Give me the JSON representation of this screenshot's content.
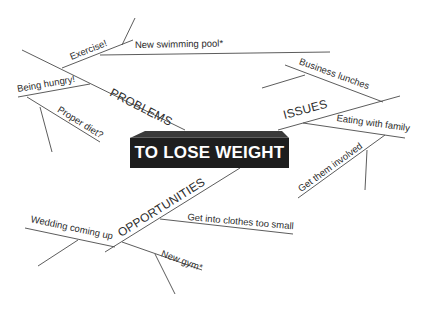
{
  "diagram": {
    "type": "mind-map",
    "center": {
      "label": "TO LOSE WEIGHT"
    },
    "branches": [
      {
        "label": "PROBLEMS",
        "children": [
          {
            "label": "Exercise!",
            "children": [
              {
                "label": "New swimming pool*"
              }
            ]
          },
          {
            "label": "Being hungry!",
            "children": [
              {
                "label": "Proper diet?"
              }
            ]
          }
        ]
      },
      {
        "label": "ISSUES",
        "children": [
          {
            "label": "Business lunches"
          },
          {
            "label": "Eating with family",
            "children": [
              {
                "label": "Get them involved"
              }
            ]
          }
        ]
      },
      {
        "label": "OPPORTUNITIES",
        "children": [
          {
            "label": "Get into clothes too small"
          },
          {
            "label": "Wedding coming up"
          },
          {
            "label": "New gym*"
          }
        ]
      }
    ],
    "colors": {
      "line": "#4a4a4a",
      "text": "#2b2b2b",
      "box_fill": "#1e1e1e",
      "box_text": "#ffffff",
      "background": "#ffffff"
    }
  }
}
